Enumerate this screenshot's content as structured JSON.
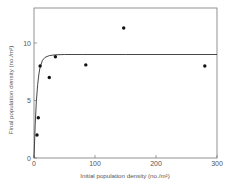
{
  "chart_data": {
    "type": "scatter",
    "title": "",
    "xlabel": "Initial population density (no./m²)",
    "ylabel": "Final population density (no./m²)",
    "xlim": [
      0,
      300
    ],
    "ylim": [
      0,
      13
    ],
    "x_ticks": [
      0,
      100,
      200,
      300
    ],
    "y_ticks": [
      0,
      5,
      10
    ],
    "x_tick_labels": [
      "0",
      "100",
      "200",
      "300"
    ],
    "y_tick_labels": [
      "0",
      "5",
      "10"
    ],
    "grid": false,
    "legend": null,
    "series": [
      {
        "name": "observed",
        "kind": "points",
        "x": [
          5,
          7,
          10,
          25,
          35,
          85,
          147,
          280
        ],
        "y": [
          2.0,
          3.5,
          8.0,
          7.0,
          8.8,
          8.1,
          11.3,
          8.0
        ]
      },
      {
        "name": "fitted asymptotic curve",
        "kind": "line",
        "asymptote": 9.0,
        "x": [
          0,
          2,
          4,
          6,
          8,
          10,
          14,
          18,
          25,
          35,
          50,
          80,
          150,
          300
        ],
        "y": [
          0,
          2.9,
          5.0,
          6.4,
          7.3,
          7.9,
          8.5,
          8.75,
          8.9,
          8.97,
          9.0,
          9.0,
          9.0,
          9.0
        ]
      }
    ]
  }
}
